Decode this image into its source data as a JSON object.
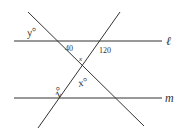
{
  "diagram": {
    "colors": {
      "line": "#333333",
      "background": "#ffffff"
    },
    "lines": [
      {
        "id": "l",
        "label": "ℓ",
        "type": "parallel"
      },
      {
        "id": "m",
        "label": "m",
        "type": "parallel"
      },
      {
        "id": "t1",
        "label": "",
        "type": "transversal"
      },
      {
        "id": "t2",
        "label": "",
        "type": "transversal"
      }
    ],
    "angle_labels": {
      "y": "y°",
      "a40": "40",
      "a120": "120",
      "x_small": "x",
      "x": "x°",
      "z": "z°"
    },
    "line_labels": {
      "l": "ℓ",
      "m": "m"
    }
  }
}
